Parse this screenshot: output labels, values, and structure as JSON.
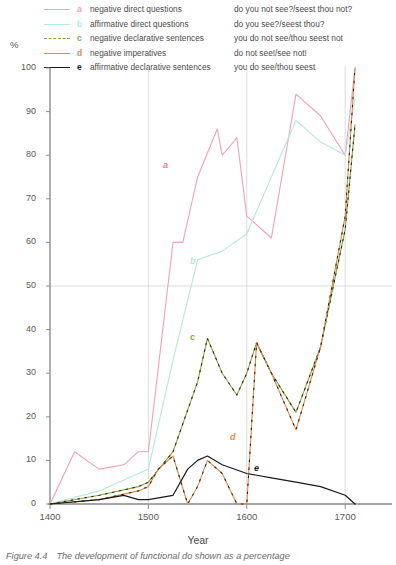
{
  "legend": {
    "rows": [
      {
        "key": "a",
        "label": "negative direct questions",
        "example": "do you not see?/seest thou not?",
        "color": "#f2a0b4"
      },
      {
        "key": "b",
        "label": "affirmative direct questions",
        "example": "do you see?/seest thou?",
        "color": "#b4e8e0"
      },
      {
        "key": "c",
        "label": "negative declarative sentences",
        "example": "you do not see/thou seest not",
        "color": "#8aa63c"
      },
      {
        "key": "d",
        "label": "negative imperatives",
        "example": "do not see!/see not!",
        "color": "#e08a4a"
      },
      {
        "key": "e",
        "label": "affirmative declarative sentences",
        "example": "you do see/thou seest",
        "color": "#1a1a1a"
      }
    ]
  },
  "axes": {
    "ylabel": "%",
    "xlabel": "Year",
    "yticks": [
      0,
      10,
      20,
      30,
      40,
      50,
      60,
      70,
      80,
      90,
      100
    ],
    "xticks": [
      1400,
      1500,
      1600,
      1700
    ]
  },
  "caption": {
    "number": "Figure 4.4",
    "text": "The development of functional do shown as a percentage"
  },
  "chart_data": {
    "type": "line",
    "title": "The development of functional do shown as a percentage",
    "xlabel": "Year",
    "ylabel": "%",
    "xlim": [
      1400,
      1710
    ],
    "ylim": [
      0,
      100
    ],
    "grid": true,
    "gridlines_x": [
      1500,
      1600,
      1700
    ],
    "gridlines_y": [
      50
    ],
    "legend_position": "top",
    "series": [
      {
        "name": "a",
        "label": "negative direct questions",
        "example": "do you not see?/seest thou not?",
        "color": "#f2a0b4",
        "style": "solid",
        "x": [
          1400,
          1425,
          1450,
          1475,
          1490,
          1500,
          1525,
          1535,
          1550,
          1570,
          1575,
          1590,
          1600,
          1625,
          1650,
          1675,
          1700,
          1710
        ],
        "values": [
          0,
          12,
          8,
          9,
          12,
          12,
          60,
          60,
          75,
          86,
          80,
          84,
          66,
          61,
          94,
          89,
          80,
          100
        ]
      },
      {
        "name": "b",
        "label": "affirmative direct questions",
        "example": "do you see?/seest thou?",
        "color": "#b4e8e0",
        "style": "solid",
        "x": [
          1400,
          1450,
          1490,
          1500,
          1525,
          1550,
          1575,
          1600,
          1625,
          1650,
          1675,
          1700,
          1710
        ],
        "values": [
          0,
          3,
          7,
          8,
          33,
          56,
          58,
          62,
          75,
          88,
          83,
          80,
          93
        ]
      },
      {
        "name": "c",
        "label": "negative declarative sentences",
        "example": "you do not see/thou seest not",
        "color": "#8aa63c",
        "style": "dashed",
        "x": [
          1400,
          1450,
          1490,
          1500,
          1525,
          1550,
          1560,
          1575,
          1590,
          1600,
          1610,
          1625,
          1650,
          1675,
          1700,
          1710
        ],
        "values": [
          0,
          2,
          4,
          5,
          12,
          28,
          38,
          30,
          25,
          30,
          37,
          30,
          21,
          36,
          63,
          87
        ]
      },
      {
        "name": "d",
        "label": "negative imperatives",
        "example": "do not see!/see not!",
        "color": "#e08a4a",
        "style": "dash-dot",
        "x": [
          1400,
          1450,
          1490,
          1500,
          1510,
          1525,
          1540,
          1550,
          1560,
          1575,
          1590,
          1600,
          1610,
          1625,
          1650,
          1675,
          1700,
          1710
        ],
        "values": [
          0,
          1,
          3,
          4,
          8,
          11,
          0,
          4,
          10,
          7,
          0,
          0,
          37,
          30,
          17,
          36,
          66,
          100
        ]
      },
      {
        "name": "e",
        "label": "affirmative declarative sentences",
        "example": "you do see/thou seest",
        "color": "#1a1a1a",
        "style": "solid",
        "x": [
          1400,
          1450,
          1475,
          1490,
          1500,
          1525,
          1540,
          1550,
          1560,
          1575,
          1600,
          1625,
          1650,
          1675,
          1700,
          1710
        ],
        "values": [
          0,
          1,
          2,
          1,
          1,
          2,
          8,
          10,
          11,
          9,
          7,
          6,
          5,
          4,
          2,
          0
        ]
      }
    ]
  }
}
